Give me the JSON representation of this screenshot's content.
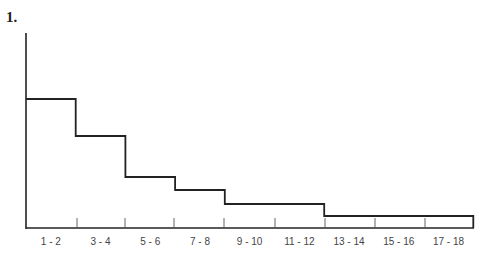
{
  "figure": {
    "label": "1."
  },
  "chart_data": {
    "type": "bar",
    "style": "step-histogram",
    "title": "",
    "xlabel": "",
    "ylabel": "",
    "categories": [
      "1 - 2",
      "3 - 4",
      "5 - 6",
      "7 - 8",
      "9 - 10",
      "11 - 12",
      "13 - 14",
      "15 - 16",
      "17 - 18"
    ],
    "values": [
      129,
      92,
      51,
      38,
      24,
      24,
      12,
      12,
      12
    ],
    "value_units": "relative height (px above baseline, no y-axis scale shown)",
    "y_axis_top": 195,
    "grid": false,
    "legend": null,
    "color": "#222222"
  },
  "layout": {
    "x0": 26,
    "bin_width": 49.7,
    "baseline_y": 228,
    "axis_top_y": 33,
    "ticks_x": [
      77,
      125,
      174,
      224,
      275,
      325,
      375,
      425
    ]
  }
}
